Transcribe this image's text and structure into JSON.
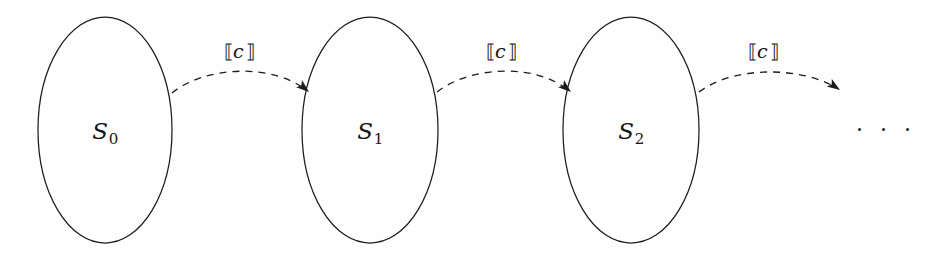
{
  "figure": {
    "kind": "state-transition-diagram",
    "background_color": "#fefefe",
    "ink_color": "#1c1c1c",
    "width": 942,
    "height": 260,
    "nodes": [
      {
        "id": "s0",
        "base": "S",
        "subscript": "0",
        "cx": 105,
        "cy": 130,
        "rx": 67,
        "ry": 113
      },
      {
        "id": "s1",
        "base": "S",
        "subscript": "1",
        "cx": 370,
        "cy": 130,
        "rx": 68,
        "ry": 113
      },
      {
        "id": "s2",
        "base": "S",
        "subscript": "2",
        "cx": 631,
        "cy": 130,
        "rx": 68,
        "ry": 113
      }
    ],
    "edges": [
      {
        "id": "e0",
        "from": "s0",
        "to": "s1",
        "label_open": "⟦",
        "label_symbol": "c",
        "label_close": "⟧",
        "label_x": 238,
        "label_y": 51,
        "path": "M 172,93 C 205,66 272,63 306,90",
        "head_x": 309,
        "head_y": 92,
        "head_angle": 40
      },
      {
        "id": "e1",
        "from": "s1",
        "to": "s2",
        "label_open": "⟦",
        "label_symbol": "c",
        "label_close": "⟧",
        "label_x": 500,
        "label_y": 51,
        "path": "M 437,92 C 470,66 535,63 568,90",
        "head_x": 571,
        "head_y": 92,
        "head_angle": 40
      },
      {
        "id": "e2",
        "from": "s2",
        "to": "ellipsis",
        "label_open": "⟦",
        "label_symbol": "c",
        "label_close": "⟧",
        "label_x": 762,
        "label_y": 51,
        "path": "M 699,92 C 733,66 800,66 837,88",
        "head_x": 840,
        "head_y": 90,
        "head_angle": 34
      }
    ],
    "continuation": {
      "id": "ellipsis",
      "text": "· · ·",
      "x": 886,
      "y": 130
    }
  }
}
